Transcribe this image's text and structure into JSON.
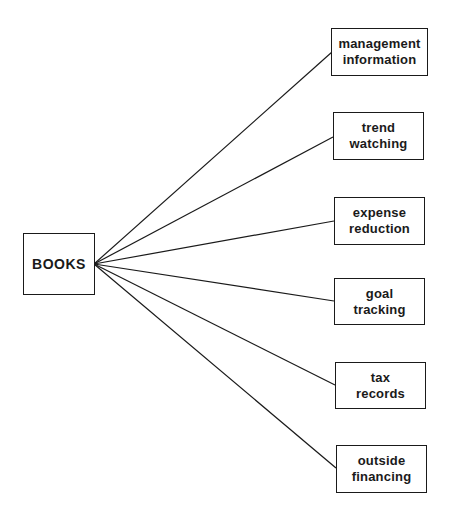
{
  "diagram": {
    "type": "fan-out",
    "root": {
      "label": "BOOKS"
    },
    "branches": [
      {
        "line1": "management",
        "line2": "information"
      },
      {
        "line1": "trend",
        "line2": "watching"
      },
      {
        "line1": "expense",
        "line2": "reduction"
      },
      {
        "line1": "goal",
        "line2": "tracking"
      },
      {
        "line1": "tax",
        "line2": "records"
      },
      {
        "line1": "outside",
        "line2": "financing"
      }
    ]
  },
  "colors": {
    "ink": "#1a1a1a",
    "background": "#ffffff"
  }
}
